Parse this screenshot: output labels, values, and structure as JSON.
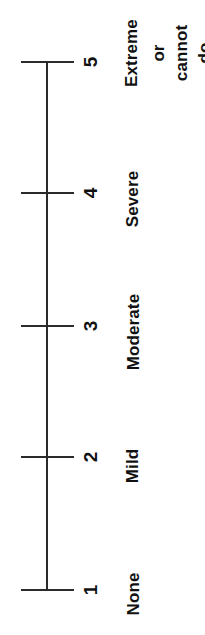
{
  "figure": {
    "name": "severity-rating-scale",
    "orientation": "rotated-90-ccw",
    "background_color": "#ffffff",
    "line_color": "#2b2b2b",
    "text_color": "#111111"
  },
  "chart_data": {
    "type": "table",
    "title": "",
    "xlabel": "",
    "ylabel": "",
    "axis_range": [
      1,
      5
    ],
    "grid": false,
    "legend": "none",
    "categories": [
      "1",
      "2",
      "3",
      "4",
      "5"
    ],
    "values": [
      1,
      2,
      3,
      4,
      5
    ],
    "tick_labels": [
      "1",
      "2",
      "3",
      "4",
      "5"
    ],
    "anchor_labels": [
      "None",
      "Mild",
      "Moderate",
      "Severe",
      "Extreme or cannot do"
    ],
    "annotations": [
      {
        "value": 1,
        "tick": "1",
        "label": "None"
      },
      {
        "value": 2,
        "tick": "2",
        "label": "Mild"
      },
      {
        "value": 3,
        "tick": "3",
        "label": "Moderate"
      },
      {
        "value": 4,
        "tick": "4",
        "label": "Severe"
      },
      {
        "value": 5,
        "tick": "5",
        "label": "Extreme or cannot do"
      }
    ]
  },
  "ticks": {
    "t1": "1",
    "t2": "2",
    "t3": "3",
    "t4": "4",
    "t5": "5"
  },
  "labels": {
    "none": "None",
    "mild": "Mild",
    "moderate": "Moderate",
    "severe": "Severe",
    "extreme_line1": "Extreme",
    "extreme_line2": "or",
    "extreme_line3": "cannot",
    "extreme_line4": "do"
  }
}
